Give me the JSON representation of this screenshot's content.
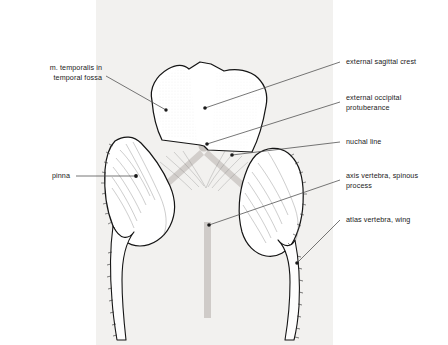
{
  "figure": {
    "panel_color": "#f2f1ef",
    "ink_color": "#1a1a1a",
    "bone_fill": "#ffffff",
    "crest_color": "#c9c5c1",
    "leader_color": "#4a4a4a"
  },
  "labels": {
    "temporalis": {
      "text": "m. temporalis in\ntemporal fossa",
      "side": "left"
    },
    "pinna": {
      "text": "pinna",
      "side": "left"
    },
    "sagittal_crest": {
      "text": "external sagittal crest",
      "side": "right"
    },
    "occipital_protuberance": {
      "text": "external occipital\nprotuberance",
      "side": "right"
    },
    "nuchal_line": {
      "text": "nuchal line",
      "side": "right"
    },
    "axis_spinous": {
      "text": "axis vertebra, spinous\nprocess",
      "side": "right"
    },
    "atlas_wing": {
      "text": "atlas vertebra, wing",
      "side": "right"
    }
  }
}
